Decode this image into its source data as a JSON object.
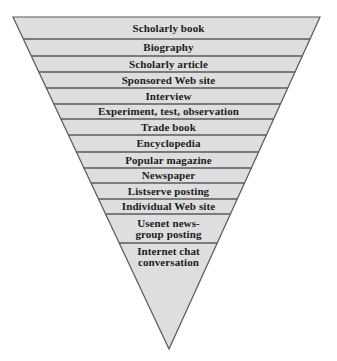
{
  "diagram": {
    "type": "inverted-pyramid",
    "colors": {
      "fill": "#dedede",
      "stroke": "#5a5a5a",
      "text": "#1c1c1c",
      "background": "#ffffff"
    },
    "geometry": {
      "top_y": 17,
      "left_x": 13,
      "right_x": 320,
      "tip_x": 169,
      "tip_y": 349
    },
    "bands": [
      {
        "label": "Scholarly book",
        "top": 17,
        "bottom": 39
      },
      {
        "label": "Biography",
        "top": 39,
        "bottom": 56
      },
      {
        "label": "Scholarly article",
        "top": 56,
        "bottom": 72
      },
      {
        "label": "Sponsored Web site",
        "top": 72,
        "bottom": 88
      },
      {
        "label": "Interview",
        "top": 88,
        "bottom": 104
      },
      {
        "label": "Experiment, test, observation",
        "top": 104,
        "bottom": 119
      },
      {
        "label": "Trade book",
        "top": 119,
        "bottom": 135
      },
      {
        "label": "Encyclopedia",
        "top": 135,
        "bottom": 152
      },
      {
        "label": "Popular magazine",
        "top": 152,
        "bottom": 168
      },
      {
        "label": "Newspaper",
        "top": 168,
        "bottom": 183
      },
      {
        "label": "Listserve posting",
        "top": 183,
        "bottom": 199
      },
      {
        "label": "Individual Web site",
        "top": 199,
        "bottom": 214
      },
      {
        "label": "Usenet news-\ngroup posting",
        "top": 214,
        "bottom": 243
      },
      {
        "label": "Internet chat\nconversation",
        "top": 243,
        "bottom": 349
      }
    ]
  }
}
